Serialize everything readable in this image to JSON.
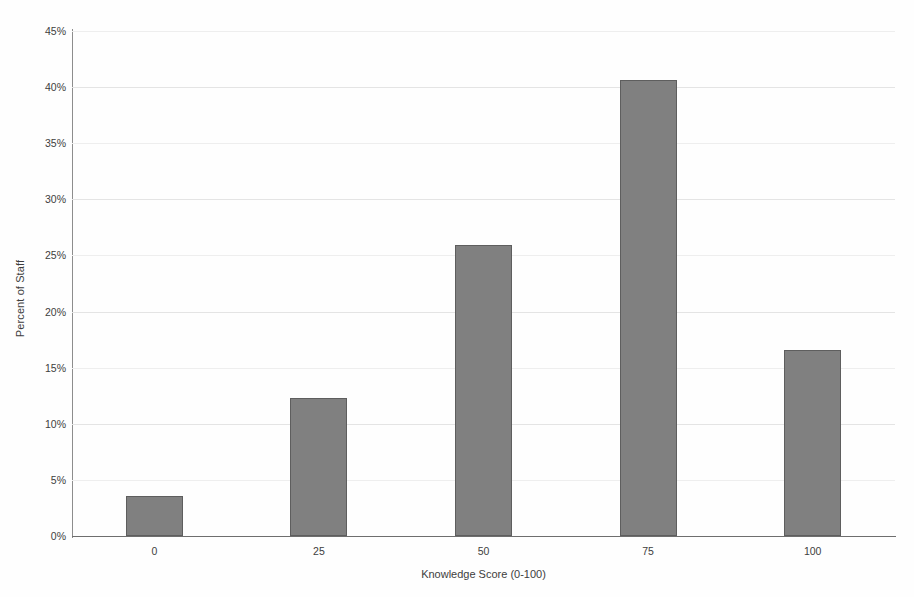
{
  "chart_data": {
    "type": "bar",
    "title": "",
    "subtitle": "",
    "categories": [
      "0",
      "25",
      "50",
      "75",
      "100"
    ],
    "values": [
      3.6,
      12.3,
      25.9,
      40.6,
      16.6
    ],
    "series": [
      {
        "name": "Percent of Staff",
        "values": [
          3.6,
          12.3,
          25.9,
          40.6,
          16.6
        ]
      }
    ],
    "xlabel": "Knowledge Score (0-100)",
    "ylabel": "Percent of Staff",
    "ylim": [
      0,
      45
    ],
    "ytick_values": [
      0,
      5,
      10,
      15,
      20,
      25,
      30,
      35,
      40,
      45
    ],
    "ytick_labels": [
      "0%",
      "5%",
      "10%",
      "15%",
      "20%",
      "25%",
      "30%",
      "35%",
      "40%",
      "45%"
    ],
    "xtick_labels": [
      "0",
      "25",
      "50",
      "75",
      "100"
    ],
    "value_suffix": "%",
    "grid": true,
    "grid_axis": "y",
    "legend": false,
    "legend_position": "none",
    "annotations": [],
    "colors": {
      "bar_fill": "#808080",
      "bar_border": "#5e5e5e",
      "gridline": "#e4e4e4",
      "axis_line": "#6e6e6e",
      "text": "#3d3d3d",
      "background": "#fefefe"
    }
  }
}
